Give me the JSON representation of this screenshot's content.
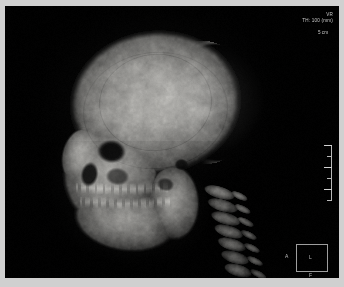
{
  "viewer": {
    "modality_label": "VR",
    "thickness_label": "TH: 100 (mm)",
    "background_color": "#010101",
    "frame_color": "#d0d0d0",
    "overlay_text_color": "#c9c9c9"
  },
  "scale_bar": {
    "label": "5 cm",
    "orientation": "vertical",
    "tick_count": 5
  },
  "orientation_cube": {
    "left_label": "A",
    "center_label": "L",
    "bottom_label": "F"
  },
  "image": {
    "description": "Lateral 3D volume-rendered CT reconstruction of a human skull",
    "anatomy": [
      "cranial vault",
      "frontal bone",
      "orbit",
      "maxilla",
      "maxillary teeth",
      "mandible",
      "mandibular teeth",
      "cervical spine",
      "occipital region"
    ]
  }
}
